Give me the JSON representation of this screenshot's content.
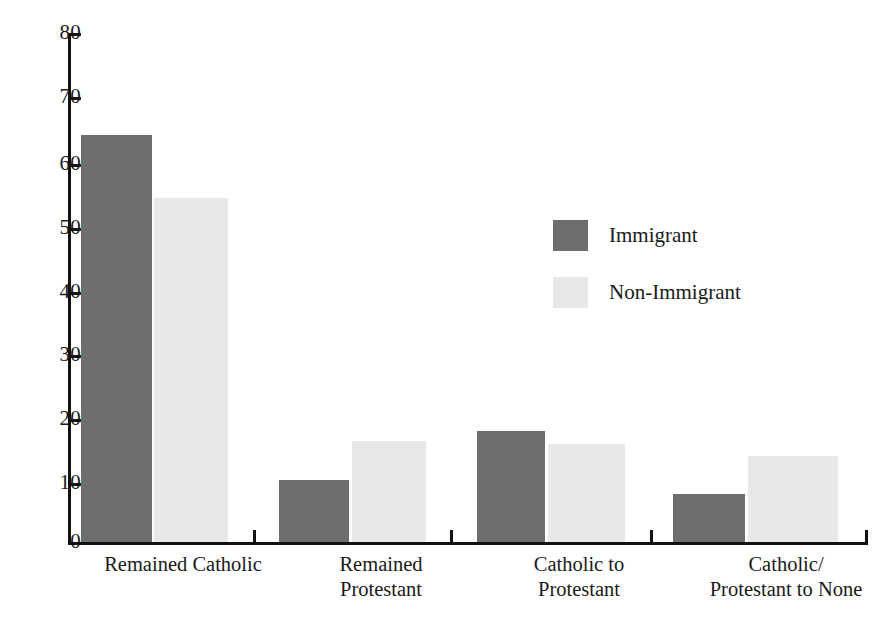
{
  "chart_data": {
    "type": "bar",
    "title": "",
    "subtitle": "",
    "xlabel": "",
    "ylabel": "",
    "grid": false,
    "ylim": [
      0,
      80
    ],
    "ytick_labels": [
      "80",
      "70",
      "60",
      "50",
      "40",
      "30",
      "20",
      "10",
      "0"
    ],
    "ytick_values": [
      80,
      70,
      60,
      50,
      40,
      30,
      20,
      10,
      0
    ],
    "categories": [
      "Remained Catholic",
      "Remained\nProtestant",
      "Catholic to\nProtestant",
      "Catholic/\nProtestant to None"
    ],
    "series": [
      {
        "name": "Immigrant",
        "color": "#6e6e6e",
        "values": [
          64,
          9.8,
          17.5,
          7.5
        ]
      },
      {
        "name": "Non-Immigrant",
        "color": "#e8e8e8",
        "values": [
          54,
          15.8,
          15.4,
          13.5
        ]
      }
    ],
    "legend": {
      "position": "center-right",
      "entries": [
        {
          "label": "Immigrant",
          "color": "#6e6e6e"
        },
        {
          "label": "Non-Immigrant",
          "color": "#e8e8e8"
        }
      ]
    },
    "axis_color": "#111111",
    "background": "#ffffff"
  },
  "layout": {
    "plot": {
      "left": 68,
      "right": 868,
      "top": 33,
      "baseline": 542
    },
    "groups": [
      {
        "dark_x": 81,
        "dark_w": 71,
        "light_x": 154,
        "light_w": 74,
        "tick_x": 253,
        "label_x": 52,
        "label_w": 262
      },
      {
        "dark_x": 279,
        "dark_w": 70,
        "light_x": 352,
        "light_w": 74,
        "tick_x": 450,
        "label_x": 250,
        "label_w": 262
      },
      {
        "dark_x": 477,
        "dark_w": 68,
        "light_x": 548,
        "light_w": 77,
        "tick_x": 650,
        "label_x": 448,
        "label_w": 262
      },
      {
        "dark_x": 673,
        "dark_w": 72,
        "light_x": 748,
        "light_w": 90,
        "tick_x": 866,
        "label_x": 646,
        "label_w": 280
      }
    ]
  }
}
